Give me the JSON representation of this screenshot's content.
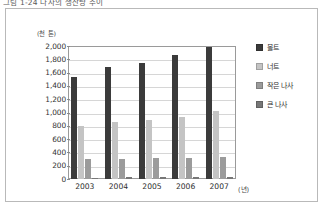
{
  "figure": {
    "caption": "그림 1-24  나사의 생산량 추이"
  },
  "chart_data": {
    "type": "bar",
    "title": "나사의 생산량 추이",
    "xlabel": "(년)",
    "ylabel": "(천 톤)",
    "categories": [
      "2003",
      "2004",
      "2005",
      "2006",
      "2007"
    ],
    "ylim": [
      0,
      2000
    ],
    "ytick_step": 200,
    "ytick_labels": [
      "2,000",
      "1,800",
      "1,600",
      "1,400",
      "1,200",
      "1,000",
      "800",
      "600",
      "400",
      "200",
      "0"
    ],
    "ytick_values": [
      2000,
      1800,
      1600,
      1400,
      1200,
      1000,
      800,
      600,
      400,
      200,
      0
    ],
    "grid": true,
    "legend_position": "right",
    "series": [
      {
        "name": "볼트",
        "color": "#3b3b3b",
        "values": [
          1540,
          1680,
          1750,
          1860,
          1980
        ]
      },
      {
        "name": "너트",
        "color": "#c4c4c4",
        "values": [
          800,
          850,
          890,
          940,
          1020
        ]
      },
      {
        "name": "작은 나사",
        "color": "#9b9b9b",
        "values": [
          300,
          300,
          310,
          315,
          325
        ]
      },
      {
        "name": "큰 나사",
        "color": "#777777",
        "values": [
          20,
          25,
          25,
          30,
          25
        ]
      }
    ]
  },
  "colors": {
    "frame_border": "#b9b9b9",
    "plot_border": "#9a9a9a",
    "gridline": "#d6d6d6",
    "background": "#ffffff"
  }
}
